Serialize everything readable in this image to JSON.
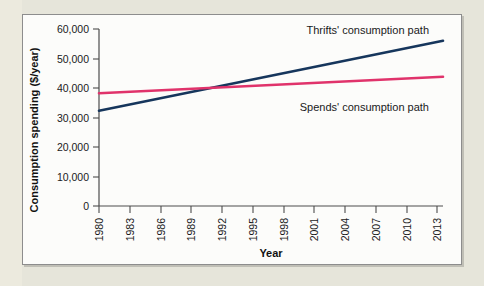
{
  "figure": {
    "panel_background": "#fcfcfa",
    "outer_background": "#e6e5da",
    "border_color": "#8d8d8d"
  },
  "chart_data": {
    "type": "line",
    "title": "",
    "xlabel": "Year",
    "ylabel": "Consumption spending ($/year)",
    "xlim": [
      1980,
      2015
    ],
    "ylim": [
      0,
      60000
    ],
    "grid": false,
    "legend_position": "inline-annotations",
    "xticks": [
      "1980",
      "1983",
      "1986",
      "1989",
      "1992",
      "1995",
      "1998",
      "2001",
      "2004",
      "2007",
      "2010",
      "2013"
    ],
    "xtick_values": [
      1980,
      1983,
      1986,
      1989,
      1992,
      1995,
      1998,
      2001,
      2004,
      2007,
      2010,
      2013
    ],
    "yticks": [
      "0",
      "10,000",
      "20,000",
      "30,000",
      "40,000",
      "50,000",
      "60,000"
    ],
    "ytick_values": [
      0,
      10000,
      20000,
      30000,
      40000,
      50000,
      60000
    ],
    "series": [
      {
        "name": "Thrifts' consumption path",
        "color": "#16365c",
        "x": [
          1980,
          2015
        ],
        "values": [
          32300,
          56000
        ]
      },
      {
        "name": "Spends' consumption path",
        "color": "#e0336b",
        "x": [
          1980,
          2015
        ],
        "values": [
          38200,
          43800
        ]
      }
    ],
    "annotations": [
      {
        "text": "Thrifts' consumption path",
        "x": 2003,
        "y": 58500
      },
      {
        "text": "Spends' consumption path",
        "x": 2003,
        "y": 37000
      }
    ]
  }
}
